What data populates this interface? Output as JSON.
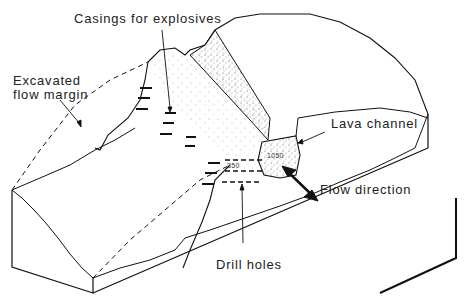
{
  "diagram": {
    "labels": {
      "casings": "Casings for explosives",
      "excavated_line1": "Excavated",
      "excavated_line2": "flow margin",
      "lava_channel": "Lava channel",
      "flow_direction": "Flow direction",
      "drill_holes": "Drill holes"
    },
    "depth_markers": {
      "channel": "1050",
      "margin": "350"
    },
    "colors": {
      "line": "#111111",
      "stipple": "#333333",
      "background": "#ffffff"
    }
  }
}
